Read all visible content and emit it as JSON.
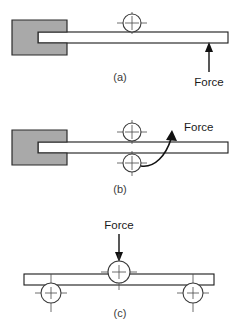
{
  "figure": {
    "panels": [
      {
        "id": "a",
        "caption": "(a)",
        "force_label": "Force",
        "force_direction": "up",
        "description": "Cantilever beam clamped at left, single roller above beam, upward force applied near free end",
        "rollers": 1,
        "clamped": true
      },
      {
        "id": "b",
        "caption": "(b)",
        "force_label": "Force",
        "force_direction": "curved-up-right",
        "description": "Cantilever beam clamped at left, two rollers above and below beam, curved force arrow",
        "rollers": 2,
        "clamped": true
      },
      {
        "id": "c",
        "caption": "(c)",
        "force_label": "Force",
        "force_direction": "down",
        "description": "Simply supported beam on two lower rollers with downward force through upper central roller",
        "rollers": 3,
        "clamped": false
      }
    ]
  },
  "colors": {
    "clamp_fill": "#a9a9a9",
    "beam_fill": "#ffffff",
    "outline": "#1a1a1a",
    "roller_stroke": "#3c3c3c",
    "centerline": "#4a4a4a",
    "caption_text": "#3a3a3a",
    "background": "#ffffff"
  }
}
